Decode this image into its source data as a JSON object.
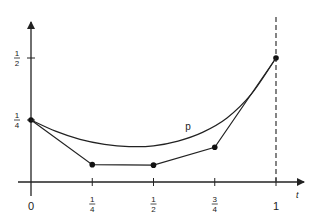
{
  "chart_data": {
    "type": "line",
    "title": "",
    "xlabel": "t",
    "ylabel": "",
    "xlim": [
      0,
      1.1
    ],
    "ylim": [
      0,
      0.55
    ],
    "x_ticks": [
      {
        "value": 0,
        "label": "0"
      },
      {
        "value": 0.25,
        "label_num": "1",
        "label_den": "4"
      },
      {
        "value": 0.5,
        "label_num": "1",
        "label_den": "2"
      },
      {
        "value": 0.75,
        "label_num": "3",
        "label_den": "4"
      },
      {
        "value": 1,
        "label": "1"
      }
    ],
    "y_ticks": [
      {
        "value": 0.25,
        "label_num": "1",
        "label_den": "4"
      },
      {
        "value": 0.5,
        "label_num": "1",
        "label_den": "2"
      }
    ],
    "series": [
      {
        "name": "control polygon",
        "style": "polyline-with-points",
        "x": [
          0,
          0.25,
          0.5,
          0.75,
          1
        ],
        "y": [
          0.25,
          0.07,
          0.068,
          0.14,
          0.5
        ]
      },
      {
        "name": "p",
        "style": "smooth-curve",
        "x": [
          0,
          0.1,
          0.2,
          0.3,
          0.4,
          0.5,
          0.6,
          0.7,
          0.8,
          0.9,
          1
        ],
        "y": [
          0.25,
          0.205,
          0.172,
          0.152,
          0.143,
          0.146,
          0.165,
          0.2,
          0.258,
          0.355,
          0.5
        ]
      }
    ],
    "vertical_line": {
      "x": 1,
      "style": "dashed"
    },
    "annotations": [
      {
        "text": "p",
        "x": 0.63,
        "y": 0.22
      }
    ],
    "grid": false,
    "legend": "none"
  }
}
